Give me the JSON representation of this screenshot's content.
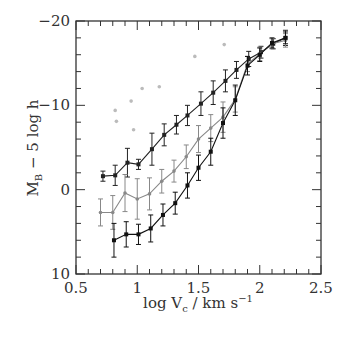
{
  "chart_data": {
    "type": "line",
    "title": "",
    "xlabel": "log V_c / km s^-1",
    "ylabel": "M_B - 5 log h",
    "xlim": [
      0.5,
      2.5
    ],
    "ylim": [
      10,
      -20
    ],
    "y_inverted": true,
    "grid": false,
    "legend": null,
    "x_ticks": [
      0.5,
      1,
      1.5,
      2,
      2.5
    ],
    "x_tick_labels": [
      "0.5",
      "1",
      "1.5",
      "2",
      "2.5"
    ],
    "x_minor_step": 0.1,
    "y_ticks": [
      -20,
      -10,
      0,
      10
    ],
    "y_tick_labels": [
      "-20",
      "-10",
      "0",
      "10"
    ],
    "y_minor_step": 2,
    "series": [
      {
        "name": "upper",
        "color": "#222222",
        "marker": "square",
        "x": [
          0.72,
          0.82,
          0.92,
          1.01,
          1.12,
          1.22,
          1.32,
          1.41,
          1.52,
          1.62,
          1.72,
          1.81,
          1.91,
          2.01,
          2.11,
          2.21
        ],
        "y": [
          -1.6,
          -1.7,
          -3.2,
          -3.0,
          -4.8,
          -6.5,
          -7.7,
          -8.8,
          -10.2,
          -11.5,
          -12.9,
          -14.2,
          -15.5,
          -16.3,
          -17.3,
          -18.0
        ],
        "err": [
          0.6,
          1.2,
          1.7,
          0.6,
          1.9,
          1.3,
          1.1,
          1.2,
          1.4,
          1.4,
          1.3,
          1.0,
          0.9,
          0.7,
          0.6,
          0.9
        ]
      },
      {
        "name": "middle",
        "color": "#888888",
        "marker": "circle",
        "x": [
          0.7,
          0.8,
          0.9,
          1.0,
          1.1,
          1.2,
          1.3,
          1.4,
          1.5,
          1.6,
          1.7,
          1.8,
          1.9,
          2.0,
          2.1,
          2.21
        ],
        "y": [
          2.7,
          2.7,
          0.4,
          1.1,
          0.5,
          -1.0,
          -2.2,
          -3.9,
          -6.0,
          -7.3,
          -8.6,
          -10.7,
          -14.9,
          -16.1,
          -17.3,
          -17.7
        ],
        "err": [
          1.6,
          2.0,
          2.2,
          2.4,
          1.9,
          1.4,
          1.3,
          1.4,
          1.6,
          1.6,
          1.8,
          1.5,
          0.9,
          0.8,
          0.6,
          0.8
        ]
      },
      {
        "name": "lower",
        "color": "#111111",
        "marker": "square",
        "x": [
          0.81,
          0.91,
          1.01,
          1.11,
          1.21,
          1.31,
          1.41,
          1.5,
          1.6,
          1.7,
          1.8,
          1.9,
          2.0,
          2.1,
          2.21
        ],
        "y": [
          6.0,
          5.3,
          5.3,
          4.6,
          3.0,
          1.6,
          -0.5,
          -2.6,
          -4.5,
          -7.9,
          -10.6,
          -14.7,
          -16.0,
          -17.4,
          -18.0
        ],
        "err": [
          2.0,
          1.5,
          1.2,
          1.6,
          1.3,
          1.3,
          1.5,
          1.5,
          1.6,
          1.8,
          1.8,
          1.1,
          0.8,
          0.6,
          0.7
        ]
      }
    ],
    "scatter": {
      "name": "faint points",
      "color": "#bbbbbb",
      "x": [
        0.82,
        0.83,
        0.95,
        0.97,
        1.04,
        1.18,
        1.47,
        1.71
      ],
      "y": [
        -9.4,
        -8.1,
        -10.5,
        -7.1,
        -12.0,
        -12.2,
        -15.8,
        -17.2
      ]
    }
  }
}
